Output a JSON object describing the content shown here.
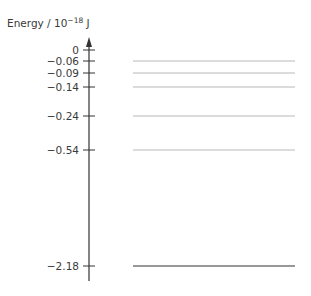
{
  "diagram": {
    "type": "energy-level-diagram",
    "axis_label": "Energy / 10",
    "axis_label_exp": "−18",
    "axis_label_unit": " J",
    "levels": [
      {
        "value": 0,
        "label": "0",
        "line": false
      },
      {
        "value": -0.06,
        "label": "−0.06",
        "line": true,
        "style": "light"
      },
      {
        "value": -0.09,
        "label": "−0.09",
        "line": true,
        "style": "light"
      },
      {
        "value": -0.14,
        "label": "−0.14",
        "line": true,
        "style": "light"
      },
      {
        "value": -0.24,
        "label": "−0.24",
        "line": true,
        "style": "light"
      },
      {
        "value": -0.54,
        "label": "−0.54",
        "line": true,
        "style": "light"
      },
      {
        "value": -2.18,
        "label": "−2.18",
        "line": true,
        "style": "dark"
      }
    ],
    "colors": {
      "axis": "#333333",
      "light_line": "#b8b8b8",
      "dark_line": "#333333",
      "text": "#3a3a3a"
    }
  }
}
